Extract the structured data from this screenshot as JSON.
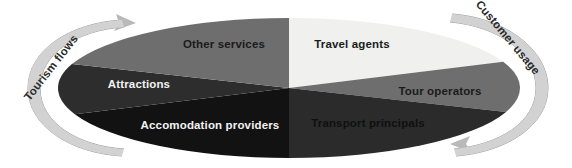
{
  "diagram": {
    "type": "segmented-ellipse",
    "center": {
      "x": 289,
      "y": 88
    },
    "radius": {
      "x": 231,
      "y": 70
    },
    "background_color": "#ffffff",
    "segments": [
      {
        "id": "travel-agents",
        "label": "Travel agents",
        "fill": "#f0f0ee",
        "text_color": "#1b1b1b",
        "text_tone": "dark",
        "start_angle": -90,
        "end_angle": -22,
        "label_x": 352,
        "label_y": 45
      },
      {
        "id": "tour-operators",
        "label": "Tour operators",
        "fill": "#6e6e6e",
        "text_color": "#1b1b1b",
        "text_tone": "dark",
        "start_angle": -22,
        "end_angle": 20,
        "label_x": 440,
        "label_y": 92
      },
      {
        "id": "transport-principals",
        "label": "Transport principals",
        "fill": "#2b2b2b",
        "text_color": "#101010",
        "text_tone": "faint",
        "start_angle": 20,
        "end_angle": 90,
        "label_x": 368,
        "label_y": 124
      },
      {
        "id": "accomodation-providers",
        "label": "Accomodation providers",
        "fill": "#121212",
        "text_color": "#f2f2f2",
        "text_tone": "light",
        "start_angle": 90,
        "end_angle": 158,
        "label_x": 210,
        "label_y": 126
      },
      {
        "id": "attractions",
        "label": "Attractions",
        "fill": "#2d2d2d",
        "text_color": "#f2f2f2",
        "text_tone": "light",
        "start_angle": 158,
        "end_angle": 200,
        "label_x": 139,
        "label_y": 85
      },
      {
        "id": "other-services",
        "label": "Other services",
        "fill": "#6e6e6e",
        "text_color": "#1b1b1b",
        "text_tone": "dark",
        "start_angle": 200,
        "end_angle": 270,
        "label_x": 224,
        "label_y": 45
      }
    ],
    "flows": [
      {
        "id": "tourism-flows",
        "label": "Tourism flows",
        "side": "left",
        "direction": "clockwise",
        "color": "#b9b9b9",
        "text_color": "#2a2a2a",
        "rotation": -52,
        "label_x": 54,
        "label_y": 70
      },
      {
        "id": "customer-usage",
        "label": "Customer usage",
        "side": "right",
        "direction": "counter-clockwise",
        "color": "#b9b9b9",
        "text_color": "#2a2a2a",
        "rotation": 50,
        "label_x": 505,
        "label_y": 40
      }
    ]
  }
}
